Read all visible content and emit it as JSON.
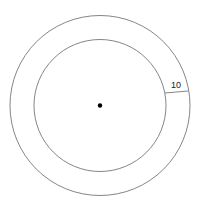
{
  "diagram": {
    "type": "annulus",
    "center": {
      "x": 100,
      "y": 105.5
    },
    "outer_circle": {
      "r": 90
    },
    "inner_circle": {
      "r": 66
    },
    "center_point": {
      "r": 2.2
    },
    "width_segment": {
      "x1": 165,
      "y1": 93,
      "x2": 188,
      "y2": 91,
      "label": "10"
    },
    "label_position": {
      "x": 176,
      "y": 88
    },
    "colors": {
      "stroke": "#777777",
      "dot": "#000000",
      "label": "#222222",
      "background": "#ffffff"
    }
  }
}
